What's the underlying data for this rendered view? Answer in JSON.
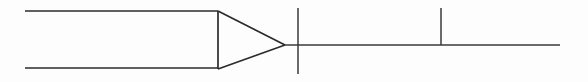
{
  "figure": {
    "background_color": "#fdfdfd",
    "stroke_color": "#2b2b2b",
    "width": 588,
    "height": 82
  },
  "geometry": {
    "top_rail": {
      "x1": 25,
      "y1": 11,
      "x2": 218,
      "y2": 11
    },
    "bottom_rail": {
      "x1": 25,
      "y1": 68,
      "x2": 218,
      "y2": 68
    },
    "base_bar": {
      "x1": 218,
      "y1": 11,
      "x2": 218,
      "y2": 69
    },
    "upper_taper": {
      "x1": 218,
      "y1": 11,
      "x2": 285,
      "y2": 45
    },
    "lower_taper": {
      "x1": 218,
      "y1": 69,
      "x2": 285,
      "y2": 45
    },
    "center_line": {
      "x1": 285,
      "y1": 45,
      "x2": 560,
      "y2": 45
    },
    "tick_one": {
      "x": 298,
      "y1": 8,
      "y2": 74
    },
    "tick_two": {
      "x": 441,
      "y1": 8,
      "y2": 45
    }
  }
}
